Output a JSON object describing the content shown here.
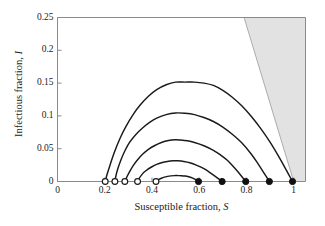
{
  "figure": {
    "background": "#ffffff",
    "frame_color": "#808080",
    "curve_color": "#1a1a1a",
    "shade_color": "#e2e2e2",
    "shade_edge_color": "#9a9a9a"
  },
  "axes": {
    "x_title_prefix": "Susceptible fraction, ",
    "x_title_var": "S",
    "y_title_prefix": "Infectious fraction, ",
    "y_title_var": "I",
    "x_ticks": [
      {
        "value": 0,
        "label": "0"
      },
      {
        "value": 0.2,
        "label": "0.2"
      },
      {
        "value": 0.4,
        "label": "0.4"
      },
      {
        "value": 0.6,
        "label": "0.6"
      },
      {
        "value": 0.8,
        "label": "0.8"
      },
      {
        "value": 1.0,
        "label": "1"
      }
    ],
    "y_ticks": [
      {
        "value": 0,
        "label": "0"
      },
      {
        "value": 0.05,
        "label": "0.05"
      },
      {
        "value": 0.1,
        "label": "0.1"
      },
      {
        "value": 0.15,
        "label": "0.15"
      },
      {
        "value": 0.2,
        "label": "0.2"
      },
      {
        "value": 0.25,
        "label": "0.25"
      }
    ]
  },
  "chart_data": {
    "type": "line",
    "title": "",
    "subtitle": "",
    "xlabel": "Susceptible fraction, S",
    "ylabel": "Infectious fraction, I",
    "xlim": [
      0,
      1.05
    ],
    "ylim": [
      0,
      0.25
    ],
    "grid": false,
    "legend": "none",
    "annotations": [
      {
        "name": "no-epidemic-region",
        "type": "shaded-polygon",
        "description": "Grey wedge in upper right bounded by the line S + I = 1 and the plot frame",
        "points": [
          [
            0.79,
            0.25
          ],
          [
            1.0,
            0.0
          ],
          [
            1.05,
            0.0
          ],
          [
            1.05,
            0.25
          ]
        ]
      }
    ],
    "markers": {
      "open_circles": {
        "label": "final susceptible fraction (end of epidemic)",
        "fill": "#ffffff",
        "edge": "#1a1a1a",
        "x": [
          0.202,
          0.243,
          0.285,
          0.339,
          0.417
        ],
        "y": [
          0,
          0,
          0,
          0,
          0
        ]
      },
      "filled_circles": {
        "label": "initial condition (start of epidemic)",
        "fill": "#111111",
        "edge": "#111111",
        "x": [
          0.597,
          0.697,
          0.797,
          0.897,
          0.995
        ],
        "y": [
          0,
          0,
          0,
          0,
          0
        ]
      }
    },
    "series": [
      {
        "name": "trajectory-1",
        "S_start": 0.995,
        "S_end": 0.202,
        "I_peak": 0.1515,
        "S_at_peak": 0.5,
        "x": [
          0.995,
          0.97,
          0.94,
          0.9,
          0.86,
          0.82,
          0.78,
          0.74,
          0.7,
          0.66,
          0.62,
          0.58,
          0.54,
          0.5,
          0.46,
          0.42,
          0.385,
          0.35,
          0.32,
          0.29,
          0.265,
          0.24,
          0.222,
          0.21,
          0.202
        ],
        "y": [
          0.0,
          0.0165,
          0.036,
          0.06,
          0.081,
          0.0995,
          0.1155,
          0.1285,
          0.139,
          0.1465,
          0.15,
          0.1515,
          0.1515,
          0.1515,
          0.1475,
          0.14,
          0.13,
          0.1165,
          0.102,
          0.084,
          0.066,
          0.044,
          0.0245,
          0.011,
          0.0
        ]
      },
      {
        "name": "trajectory-2",
        "S_start": 0.897,
        "S_end": 0.243,
        "I_peak": 0.1045,
        "S_at_peak": 0.5,
        "x": [
          0.897,
          0.875,
          0.85,
          0.82,
          0.78,
          0.74,
          0.7,
          0.66,
          0.62,
          0.58,
          0.54,
          0.5,
          0.46,
          0.42,
          0.39,
          0.36,
          0.33,
          0.305,
          0.285,
          0.268,
          0.255,
          0.247,
          0.243
        ],
        "y": [
          0.0,
          0.0125,
          0.0265,
          0.042,
          0.059,
          0.072,
          0.083,
          0.0915,
          0.0975,
          0.102,
          0.104,
          0.1045,
          0.102,
          0.0965,
          0.09,
          0.0815,
          0.071,
          0.0595,
          0.0465,
          0.0325,
          0.019,
          0.008,
          0.0
        ]
      },
      {
        "name": "trajectory-3",
        "S_start": 0.797,
        "S_end": 0.285,
        "I_peak": 0.0635,
        "S_at_peak": 0.5,
        "x": [
          0.797,
          0.775,
          0.75,
          0.72,
          0.69,
          0.66,
          0.62,
          0.58,
          0.55,
          0.52,
          0.5,
          0.47,
          0.44,
          0.41,
          0.385,
          0.36,
          0.34,
          0.322,
          0.306,
          0.295,
          0.289,
          0.285
        ],
        "y": [
          0.0,
          0.01,
          0.0205,
          0.032,
          0.0405,
          0.0475,
          0.0545,
          0.0595,
          0.062,
          0.0632,
          0.0635,
          0.0625,
          0.0595,
          0.0545,
          0.049,
          0.0415,
          0.0335,
          0.025,
          0.0155,
          0.008,
          0.003,
          0.0
        ]
      },
      {
        "name": "trajectory-4",
        "S_start": 0.697,
        "S_end": 0.339,
        "I_peak": 0.0315,
        "S_at_peak": 0.505,
        "x": [
          0.697,
          0.675,
          0.65,
          0.62,
          0.59,
          0.56,
          0.535,
          0.51,
          0.49,
          0.465,
          0.44,
          0.42,
          0.4,
          0.382,
          0.366,
          0.354,
          0.345,
          0.339
        ],
        "y": [
          0.0,
          0.006,
          0.0125,
          0.0195,
          0.0245,
          0.0285,
          0.0305,
          0.0315,
          0.0315,
          0.0305,
          0.0285,
          0.026,
          0.0225,
          0.0185,
          0.014,
          0.009,
          0.0045,
          0.0
        ]
      },
      {
        "name": "trajectory-5",
        "S_start": 0.597,
        "S_end": 0.417,
        "I_peak": 0.009,
        "S_at_peak": 0.505,
        "x": [
          0.597,
          0.585,
          0.57,
          0.555,
          0.54,
          0.525,
          0.51,
          0.495,
          0.48,
          0.466,
          0.452,
          0.44,
          0.43,
          0.422,
          0.417
        ],
        "y": [
          0.0,
          0.0028,
          0.0055,
          0.0073,
          0.0084,
          0.0089,
          0.009,
          0.009,
          0.0086,
          0.0078,
          0.0066,
          0.005,
          0.0033,
          0.0016,
          0.0
        ]
      }
    ]
  }
}
